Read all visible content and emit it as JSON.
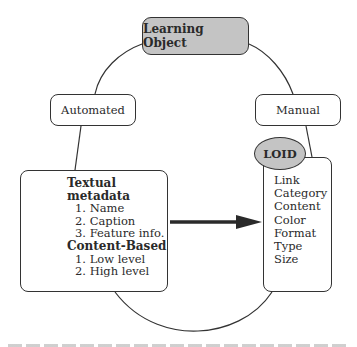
{
  "diagram": {
    "root": {
      "label": "Learning Object",
      "fill": "#c4c4c4"
    },
    "branches": [
      {
        "label": "Automated"
      },
      {
        "label": "Manual"
      }
    ],
    "automated_panel": {
      "sections": [
        {
          "heading": "Textual metadata",
          "items": [
            "1. Name",
            "2. Caption",
            "3. Feature info."
          ]
        },
        {
          "heading": "Content-Based",
          "items": [
            "1. Low level",
            "2. High level"
          ]
        }
      ]
    },
    "manual_panel": {
      "badge": {
        "label": "LOID",
        "fill": "#c4c4c4"
      },
      "items": [
        "Link",
        "Category",
        "Content",
        "Color",
        "Format",
        "Type",
        "Size"
      ]
    },
    "arrow": {
      "from": "automated_panel",
      "to": "manual_panel",
      "color": "#2a2a2a"
    },
    "caption": {
      "visible": "cropped",
      "text": ""
    }
  }
}
